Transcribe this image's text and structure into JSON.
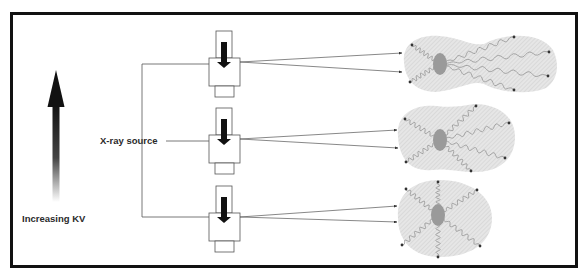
{
  "figure": {
    "labels": {
      "kv_arrow": "Increasing KV",
      "source": "X-ray source"
    },
    "colors": {
      "frame": "#111111",
      "blob_fill": "#e4e4e4",
      "blob_hatch": "#cfcfcf",
      "nucleus": "#9a9a9a",
      "arrow": "#111111"
    },
    "tubes": [
      {
        "id": "tube-high",
        "kv_level": "high"
      },
      {
        "id": "tube-medium",
        "kv_level": "medium"
      },
      {
        "id": "tube-low",
        "kv_level": "low"
      }
    ],
    "scatter_patterns": [
      {
        "id": "pattern-high",
        "shape": "forward-elongated",
        "electron_tracks": 6
      },
      {
        "id": "pattern-medium",
        "shape": "slightly-elongated",
        "electron_tracks": 6
      },
      {
        "id": "pattern-low",
        "shape": "round",
        "electron_tracks": 6
      }
    ]
  }
}
